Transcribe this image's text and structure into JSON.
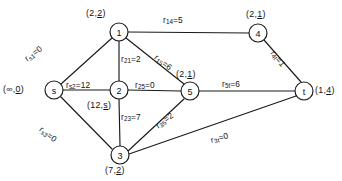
{
  "figure": {
    "type": "network-flow-graph"
  },
  "nodes": [
    {
      "id": "s",
      "name": "s",
      "cx": 54,
      "cy": 90,
      "r": 9,
      "tag_prefix": "(∞,",
      "tag_underlined": "0",
      "tag_suffix": ")",
      "tag_full": "(∞,0)",
      "tag_x": 3,
      "tag_y": 85
    },
    {
      "id": "1",
      "name": "1",
      "cx": 119,
      "cy": 32,
      "r": 9,
      "tag_prefix": "(2,",
      "tag_underlined": "2",
      "tag_suffix": ")",
      "tag_full": "(2,2)",
      "tag_x": 86,
      "tag_y": 9
    },
    {
      "id": "2",
      "name": "2",
      "cx": 119,
      "cy": 90,
      "r": 9,
      "tag_prefix": "(12,",
      "tag_underlined": "s",
      "tag_suffix": ")",
      "tag_full": "(12,s)",
      "tag_x": 87,
      "tag_y": 101
    },
    {
      "id": "3",
      "name": "3",
      "cx": 120,
      "cy": 155,
      "r": 9,
      "tag_prefix": "(7,",
      "tag_underlined": "2",
      "tag_suffix": ")",
      "tag_full": "(7,2)",
      "tag_x": 105,
      "tag_y": 166
    },
    {
      "id": "4",
      "name": "4",
      "cx": 258,
      "cy": 33,
      "r": 9,
      "tag_prefix": "(2,",
      "tag_underlined": "1",
      "tag_suffix": ")",
      "tag_full": "(2,1)",
      "tag_x": 246,
      "tag_y": 10
    },
    {
      "id": "5",
      "name": "5",
      "cx": 190,
      "cy": 91,
      "r": 9,
      "tag_prefix": "(2,",
      "tag_underlined": "1",
      "tag_suffix": ")",
      "tag_full": "(2,1)",
      "tag_x": 176,
      "tag_y": 70
    },
    {
      "id": "t",
      "name": "t",
      "cx": 304,
      "cy": 91,
      "r": 9,
      "tag_prefix": "(1,",
      "tag_underlined": "4",
      "tag_suffix": ")",
      "tag_full": "(1,4)",
      "tag_x": 315,
      "tag_y": 86
    }
  ],
  "edges": [
    {
      "id": "s1",
      "from": "s",
      "to": "1",
      "sub": "s1",
      "value": "0",
      "text": "r s1 =0",
      "x1": 61,
      "y1": 84,
      "x2": 112,
      "y2": 38,
      "lx": 26,
      "ly": 55,
      "rot": "rot-e"
    },
    {
      "id": "s2",
      "from": "s",
      "to": "2",
      "sub": "s2",
      "value": "12",
      "text": "r s2 =12",
      "x1": 63,
      "y1": 90,
      "x2": 110,
      "y2": 90,
      "lx": 66,
      "ly": 81,
      "rot": "rot-v"
    },
    {
      "id": "s3",
      "from": "s",
      "to": "3",
      "sub": "s3",
      "value": "0",
      "text": "r s3 =0",
      "x1": 61,
      "y1": 97,
      "x2": 112,
      "y2": 149,
      "lx": 40,
      "ly": 124,
      "rot": "rot-d"
    },
    {
      "id": "14",
      "from": "1",
      "to": "4",
      "sub": "14",
      "value": "5",
      "text": "r 14 =5",
      "x1": 128,
      "y1": 32,
      "x2": 249,
      "y2": 33,
      "lx": 163,
      "ly": 16,
      "rot": "rot-v"
    },
    {
      "id": "21",
      "from": "2",
      "to": "1",
      "sub": "21",
      "value": "2",
      "text": "r 21 =2",
      "x1": 119,
      "y1": 41,
      "x2": 119,
      "y2": 81,
      "lx": 121,
      "ly": 55,
      "rot": "rot-v"
    },
    {
      "id": "15",
      "from": "1",
      "to": "5",
      "sub": "15",
      "value": "6",
      "text": "r 15 =6",
      "x1": 126,
      "y1": 38,
      "x2": 184,
      "y2": 84,
      "lx": 155,
      "ly": 52,
      "rot": "rot-d"
    },
    {
      "id": "25",
      "from": "2",
      "to": "5",
      "sub": "25",
      "value": "0",
      "text": "r 25 =0",
      "x1": 128,
      "y1": 90,
      "x2": 181,
      "y2": 91,
      "lx": 135,
      "ly": 81,
      "rot": "rot-v"
    },
    {
      "id": "23",
      "from": "2",
      "to": "3",
      "sub": "23",
      "value": "7",
      "text": "r 23 =7",
      "x1": 119,
      "y1": 99,
      "x2": 120,
      "y2": 146,
      "lx": 121,
      "ly": 113,
      "rot": "rot-v"
    },
    {
      "id": "35",
      "from": "3",
      "to": "5",
      "sub": "35",
      "value": "2",
      "text": "r 35 =2",
      "x1": 128,
      "y1": 151,
      "x2": 184,
      "y2": 99,
      "lx": 157,
      "ly": 122,
      "rot": "rot-e"
    },
    {
      "id": "3t",
      "from": "3",
      "to": "t",
      "sub": "3t",
      "value": "0",
      "text": "r 3t =0",
      "x1": 129,
      "y1": 154,
      "x2": 296,
      "y2": 96,
      "lx": 211,
      "ly": 136,
      "rot": "rot-f"
    },
    {
      "id": "5t",
      "from": "5",
      "to": "t",
      "sub": "5t",
      "value": "6",
      "text": "r 5t =6",
      "x1": 199,
      "y1": 91,
      "x2": 295,
      "y2": 91,
      "lx": 222,
      "ly": 80,
      "rot": "rot-v"
    },
    {
      "id": "4t",
      "from": "4",
      "to": "t",
      "sub": "4t",
      "value": "1",
      "text": "r 4t =1",
      "x1": 264,
      "y1": 40,
      "x2": 301,
      "y2": 82,
      "lx": 272,
      "ly": 47,
      "rot": "rot-h"
    }
  ],
  "colors": {
    "ink": "#1a1a1a",
    "background": "#ffffff"
  }
}
